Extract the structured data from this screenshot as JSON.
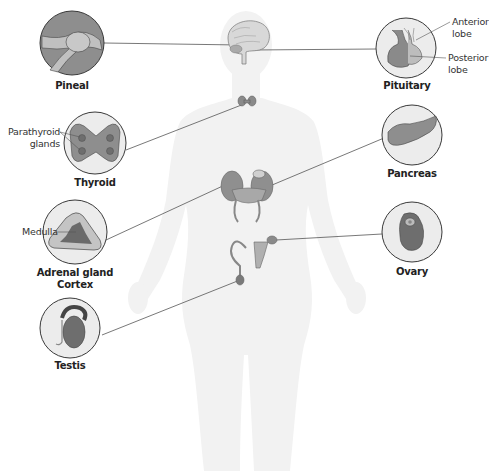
{
  "diagram": {
    "glands": [
      {
        "id": "pineal",
        "label": "Pineal",
        "side": "left"
      },
      {
        "id": "pituitary",
        "label": "Pituitary",
        "side": "right",
        "callouts": [
          "Anterior lobe",
          "Posterior lobe"
        ]
      },
      {
        "id": "thyroid",
        "label": "Thyroid",
        "side": "left",
        "callouts": [
          "Parathyroid glands"
        ]
      },
      {
        "id": "pancreas",
        "label": "Pancreas",
        "side": "right"
      },
      {
        "id": "adrenal",
        "label": "Adrenal gland",
        "label2": "Cortex",
        "side": "left",
        "callouts": [
          "Medulla"
        ]
      },
      {
        "id": "ovary",
        "label": "Ovary",
        "side": "right"
      },
      {
        "id": "testis",
        "label": "Testis",
        "side": "left"
      }
    ],
    "callout_text": {
      "anterior_1": "Anterior",
      "anterior_2": "lobe",
      "posterior_1": "Posterior",
      "posterior_2": "lobe",
      "parathyroid_1": "Parathyroid",
      "parathyroid_2": "glands",
      "medulla": "Medulla"
    },
    "colors": {
      "circle_fill": "#ececec",
      "circle_stroke": "#3a3a3a",
      "organ_dark": "#7a7a7a",
      "organ_mid": "#9a9a9a",
      "organ_light": "#c8c8c8",
      "silhouette": "#f2f2f2",
      "leader_line": "#555555"
    }
  }
}
